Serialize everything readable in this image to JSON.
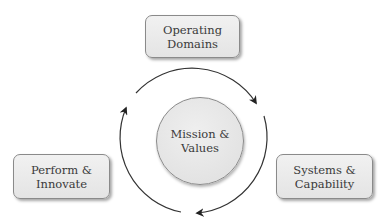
{
  "diagram": {
    "type": "cycle",
    "center": {
      "line1": "Mission &",
      "line2": "Values"
    },
    "nodes": [
      {
        "id": "operating-domains",
        "line1": "Operating",
        "line2": "Domains",
        "position": "top"
      },
      {
        "id": "systems-capability",
        "line1": "Systems &",
        "line2": "Capability",
        "position": "bottom-right"
      },
      {
        "id": "perform-innovate",
        "line1": "Perform &",
        "line2": "Innovate",
        "position": "bottom-left"
      }
    ],
    "flow_direction": "clockwise",
    "colors": {
      "box_fill": "#e8e8e8",
      "box_border": "#8a8a8a",
      "arc": "#333333",
      "text": "#3a3a3a"
    }
  }
}
